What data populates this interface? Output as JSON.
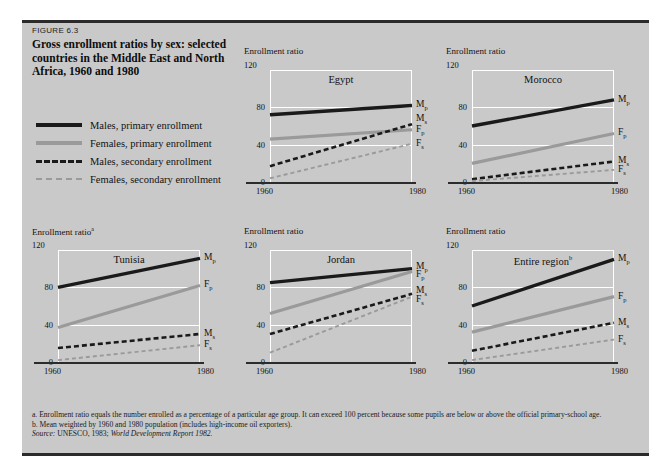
{
  "figure": {
    "number": "FIGURE 6.3",
    "title": "Gross enrollment ratios by sex: selected countries in the Middle East and North Africa, 1960 and 1980",
    "background_color": "#c9c9c9",
    "rule_color": "#2b2b2b"
  },
  "legend": {
    "items": [
      {
        "label": "Males, primary enrollment",
        "style": "solid",
        "color": "#1a1a1a",
        "key": "Mp"
      },
      {
        "label": "Females, primary enrollment",
        "style": "solid",
        "color": "#9a9a9a",
        "key": "Fp"
      },
      {
        "label": "Males, secondary enrollment",
        "style": "dashed",
        "color": "#1a1a1a",
        "key": "Ms"
      },
      {
        "label": "Females, secondary enrollment",
        "style": "dashed",
        "color": "#9a9a9a",
        "key": "Fs"
      }
    ]
  },
  "notes": {
    "a": "a.  Enrollment ratio equals the number enrolled as a percentage of a particular age group. It can exceed 100 percent because some pupils are below or above the official primary-school age.",
    "b": "b.  Mean weighted by 1960 and 1980 population (includes high-income oil exporters).",
    "source_prefix": "Source:",
    "source_text": "UNESCO, 1983;",
    "source_italic": "World Development Report 1982."
  },
  "chart_data": [
    {
      "type": "line",
      "title": "Egypt",
      "title_superscript": "",
      "ylabel": "Enrollment ratio",
      "ylabel_superscript": "",
      "xlabel": "",
      "x": [
        1960,
        1980
      ],
      "xticks": [
        "1960",
        "1980"
      ],
      "yticks": [
        0,
        40,
        80,
        120
      ],
      "ymax_label": "120",
      "ylim": [
        0,
        120
      ],
      "grid": true,
      "series": [
        {
          "name": "Males, primary enrollment",
          "key": "Mp",
          "label": "M",
          "sublabel": "p",
          "values": [
            72,
            82
          ]
        },
        {
          "name": "Females, primary enrollment",
          "key": "Fp",
          "label": "F",
          "sublabel": "p",
          "values": [
            46,
            56
          ]
        },
        {
          "name": "Males, secondary enrollment",
          "key": "Ms",
          "label": "M",
          "sublabel": "s",
          "values": [
            17,
            62
          ]
        },
        {
          "name": "Females, secondary enrollment",
          "key": "Fs",
          "label": "F",
          "sublabel": "s",
          "values": [
            4,
            41
          ]
        }
      ],
      "label_y": {
        "Mp": 82,
        "Ms": 68,
        "Fp": 56,
        "Fs": 41
      }
    },
    {
      "type": "line",
      "title": "Morocco",
      "title_superscript": "",
      "ylabel": "Enrollment ratio",
      "ylabel_superscript": "",
      "xlabel": "",
      "x": [
        1960,
        1980
      ],
      "xticks": [
        "1960",
        "1980"
      ],
      "yticks": [
        0,
        40,
        80,
        120
      ],
      "ymax_label": "120",
      "ylim": [
        0,
        120
      ],
      "grid": true,
      "series": [
        {
          "name": "Males, primary enrollment",
          "key": "Mp",
          "label": "M",
          "sublabel": "p",
          "values": [
            60,
            88
          ]
        },
        {
          "name": "Females, primary enrollment",
          "key": "Fp",
          "label": "F",
          "sublabel": "p",
          "values": [
            20,
            52
          ]
        },
        {
          "name": "Males, secondary enrollment",
          "key": "Ms",
          "label": "M",
          "sublabel": "s",
          "values": [
            3,
            22
          ]
        },
        {
          "name": "Females, secondary enrollment",
          "key": "Fs",
          "label": "F",
          "sublabel": "s",
          "values": [
            1,
            13
          ]
        }
      ],
      "label_y": {
        "Mp": 88,
        "Fp": 52,
        "Ms": 22,
        "Fs": 13
      }
    },
    {
      "type": "line",
      "title": "Tunisia",
      "title_superscript": "",
      "ylabel": "Enrollment ratio",
      "ylabel_superscript": "a",
      "xlabel": "",
      "x": [
        1960,
        1980
      ],
      "xticks": [
        "1960",
        "1980"
      ],
      "yticks": [
        0,
        40,
        80,
        120
      ],
      "ymax_label": "120",
      "ylim": [
        0,
        120
      ],
      "grid": true,
      "series": [
        {
          "name": "Males, primary enrollment",
          "key": "Mp",
          "label": "M",
          "sublabel": "p",
          "values": [
            80,
            111
          ]
        },
        {
          "name": "Females, primary enrollment",
          "key": "Fp",
          "label": "F",
          "sublabel": "p",
          "values": [
            37,
            82
          ]
        },
        {
          "name": "Males, secondary enrollment",
          "key": "Ms",
          "label": "M",
          "sublabel": "s",
          "values": [
            15,
            30
          ]
        },
        {
          "name": "Females, secondary enrollment",
          "key": "Fs",
          "label": "F",
          "sublabel": "s",
          "values": [
            2,
            18
          ]
        }
      ],
      "label_y": {
        "Mp": 111,
        "Fp": 82,
        "Ms": 30,
        "Fs": 18
      }
    },
    {
      "type": "line",
      "title": "Jordan",
      "title_superscript": "",
      "ylabel": "Enrollment ratio",
      "ylabel_superscript": "",
      "xlabel": "",
      "x": [
        1960,
        1980
      ],
      "xticks": [
        "1960",
        "1980"
      ],
      "yticks": [
        0,
        40,
        80,
        120
      ],
      "ymax_label": "120",
      "ylim": [
        0,
        120
      ],
      "grid": true,
      "series": [
        {
          "name": "Males, primary enrollment",
          "key": "Mp",
          "label": "M",
          "sublabel": "p",
          "values": [
            85,
            100
          ]
        },
        {
          "name": "Females, primary enrollment",
          "key": "Fp",
          "label": "F",
          "sublabel": "p",
          "values": [
            52,
            97
          ]
        },
        {
          "name": "Males, secondary enrollment",
          "key": "Ms",
          "label": "M",
          "sublabel": "s",
          "values": [
            30,
            73
          ]
        },
        {
          "name": "Females, secondary enrollment",
          "key": "Fs",
          "label": "F",
          "sublabel": "s",
          "values": [
            10,
            70
          ]
        }
      ],
      "label_y": {
        "Mp": 102,
        "Fp": 93,
        "Ms": 76,
        "Fs": 66
      }
    },
    {
      "type": "line",
      "title": "Entire region",
      "title_superscript": "b",
      "ylabel": "Enrollment ratio",
      "ylabel_superscript": "",
      "xlabel": "",
      "x": [
        1960,
        1980
      ],
      "xticks": [
        "1960",
        "1980"
      ],
      "yticks": [
        0,
        40,
        80,
        120
      ],
      "ymax_label": "120",
      "ylim": [
        0,
        120
      ],
      "grid": true,
      "series": [
        {
          "name": "Males, primary enrollment",
          "key": "Mp",
          "label": "M",
          "sublabel": "p",
          "values": [
            60,
            110
          ]
        },
        {
          "name": "Females, primary enrollment",
          "key": "Fp",
          "label": "F",
          "sublabel": "p",
          "values": [
            32,
            70
          ]
        },
        {
          "name": "Males, secondary enrollment",
          "key": "Ms",
          "label": "M",
          "sublabel": "s",
          "values": [
            12,
            42
          ]
        },
        {
          "name": "Females, secondary enrollment",
          "key": "Fs",
          "label": "F",
          "sublabel": "s",
          "values": [
            2,
            24
          ]
        }
      ],
      "label_y": {
        "Mp": 110,
        "Fp": 70,
        "Ms": 42,
        "Fs": 24
      }
    }
  ]
}
